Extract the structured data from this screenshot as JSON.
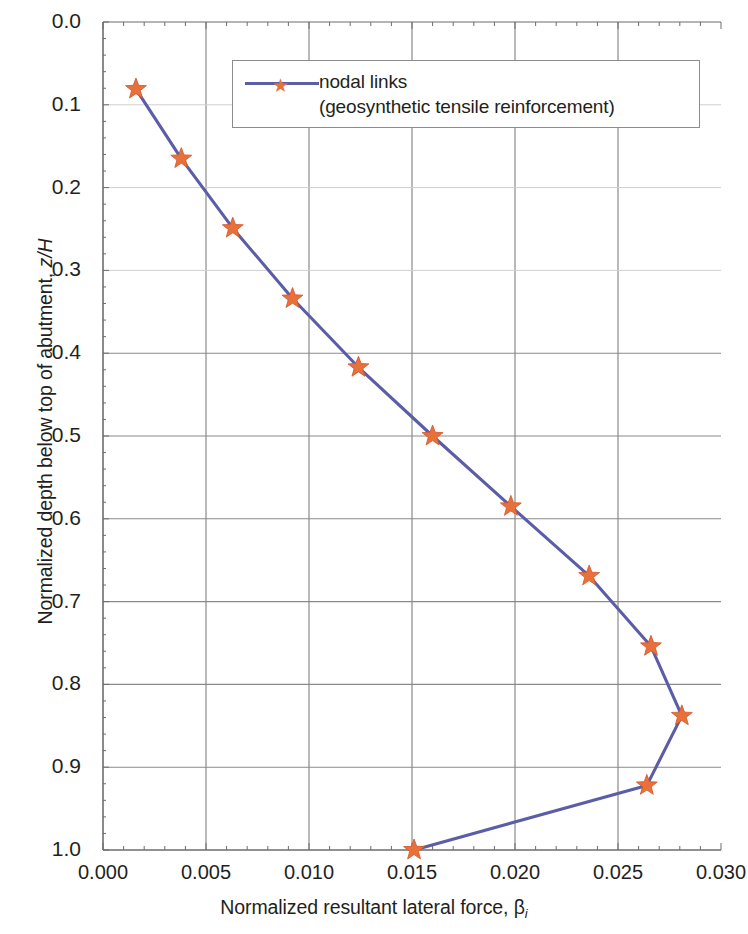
{
  "chart_data": {
    "type": "line",
    "title": "",
    "xlabel": "Normalized resultant lateral force, β",
    "xlabel_subscript": "i",
    "ylabel": "Normalized depth below top of abutment, z/H",
    "ylabel_plain": "Normalized depth below top of abutment, ",
    "ylabel_italic": "z/H",
    "xlim": [
      0.0,
      0.03
    ],
    "ylim": [
      0.0,
      1.0
    ],
    "y_inverted": true,
    "xticks": [
      0.0,
      0.005,
      0.01,
      0.015,
      0.02,
      0.025,
      0.03
    ],
    "xticklabels": [
      "0.000",
      "0.005",
      "0.010",
      "0.015",
      "0.020",
      "0.025",
      "0.030"
    ],
    "yticks": [
      0.0,
      0.1,
      0.2,
      0.3,
      0.4,
      0.5,
      0.6,
      0.7,
      0.8,
      0.9,
      1.0
    ],
    "yticklabels": [
      "0.0",
      "0.1",
      "0.2",
      "0.3",
      "0.4",
      "0.5",
      "0.6",
      "0.7",
      "0.8",
      "0.9",
      "1.0"
    ],
    "grid": true,
    "grid_major_x": [
      0.005,
      0.01,
      0.015,
      0.02,
      0.025
    ],
    "grid_major_y": [
      0.1,
      0.2,
      0.3,
      0.4,
      0.5,
      0.6,
      0.7,
      0.8,
      0.9
    ],
    "legend_position": "top-right-inside",
    "line_color": "#5b5ea6",
    "marker_color": "#e8703a",
    "marker": "star",
    "axis_color": "#6d6d6d",
    "grid_color": "#c9c9c9",
    "series": [
      {
        "name": "nodal links",
        "name_line2": "(geosynthetic tensile reinforcement)",
        "x": [
          0.0016,
          0.0038,
          0.0063,
          0.0092,
          0.0124,
          0.016,
          0.0198,
          0.0236,
          0.0266,
          0.0281,
          0.0264,
          0.0151
        ],
        "y": [
          0.081,
          0.165,
          0.249,
          0.334,
          0.417,
          0.5,
          0.585,
          0.669,
          0.754,
          0.838,
          0.922,
          1.0
        ]
      }
    ]
  },
  "legend": {
    "line1": "nodal links",
    "line2": "(geosynthetic tensile reinforcement)"
  }
}
